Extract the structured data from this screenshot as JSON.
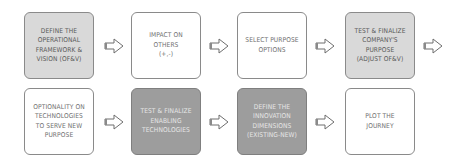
{
  "diagram": {
    "type": "process-flow",
    "rows": [
      {
        "steps": [
          {
            "id": "s1",
            "label": "Define the\noperational\nframework &\nvision (OF&V)",
            "style": "light"
          },
          {
            "id": "s2",
            "label": "Impact on\nothers\n(+,-)",
            "style": "white"
          },
          {
            "id": "s3",
            "label": "Select purpose\noptions",
            "style": "white"
          },
          {
            "id": "s4",
            "label": "Test & finalize\ncompany's\npurpose\n(adjust OF&V)",
            "style": "light"
          }
        ]
      },
      {
        "steps": [
          {
            "id": "s5",
            "label": "Optionality on\ntechnologies\nto serve new\npurpose",
            "style": "white"
          },
          {
            "id": "s6",
            "label": "Test & finalize\nenabling\ntechnologies",
            "style": "dark"
          },
          {
            "id": "s7",
            "label": "Define the\ninnovation\ndimensions\n(existing-new)",
            "style": "dark"
          },
          {
            "id": "s8",
            "label": "Plot the\njourney",
            "style": "white"
          }
        ]
      }
    ],
    "connector_icon": "outline-right-arrow-icon",
    "colors": {
      "light_fill": "#d9d9d9",
      "dark_fill": "#9d9d9d",
      "border": "#8a8a8a",
      "arrow_stroke": "#6e6e6e"
    }
  }
}
